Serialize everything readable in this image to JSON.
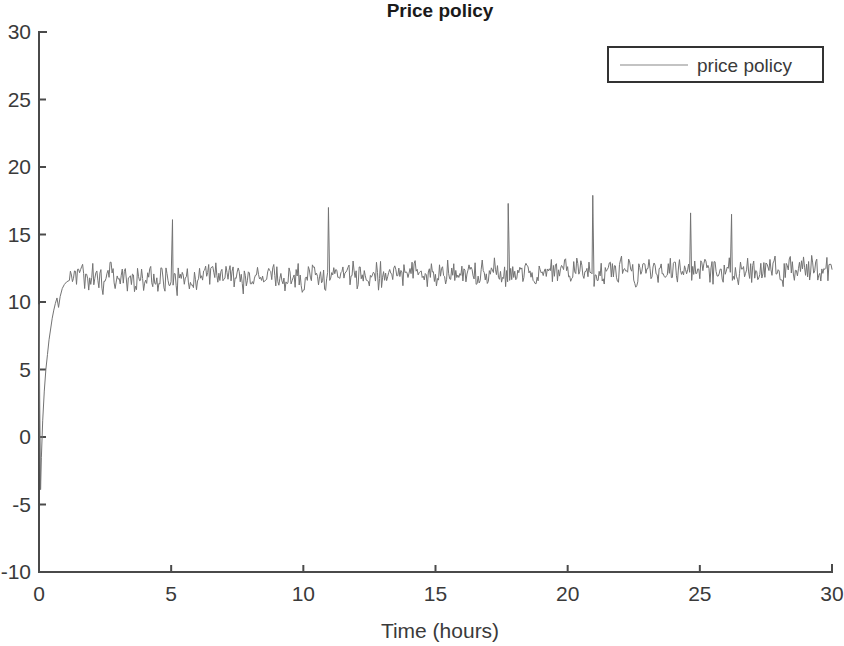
{
  "chart_data": {
    "type": "line",
    "title": "Price policy",
    "xlabel": "Time (hours)",
    "ylabel": "",
    "xlim": [
      0,
      30
    ],
    "ylim": [
      -10,
      30
    ],
    "xticks": [
      0,
      5,
      10,
      15,
      20,
      25,
      30
    ],
    "yticks": [
      -10,
      -5,
      0,
      5,
      10,
      15,
      20,
      25,
      30
    ],
    "xtick_labels": [
      "0",
      "5",
      "10",
      "15",
      "20",
      "25",
      "30"
    ],
    "ytick_labels": [
      "-10",
      "-5",
      "0",
      "5",
      "10",
      "15",
      "20",
      "25",
      "30"
    ],
    "grid": false,
    "legend_position": "top-right",
    "series": [
      {
        "name": "price policy",
        "color": "#737373",
        "description": "Noisy price signal: sharp negative transient at start dropping to about -4, rapid rise through 0 and 5 to settle near 12.3 by t=1, then a noisy steady-state band roughly 10.8 to 13.8 for the remainder, punctuated by occasional upward spikes.",
        "transient": {
          "points": [
            [
              0.0,
              9.8
            ],
            [
              0.03,
              2.0
            ],
            [
              0.06,
              -3.9
            ],
            [
              0.09,
              -1.5
            ],
            [
              0.14,
              1.2
            ],
            [
              0.2,
              3.4
            ],
            [
              0.26,
              5.0
            ],
            [
              0.32,
              6.1
            ],
            [
              0.38,
              7.2
            ],
            [
              0.44,
              8.0
            ],
            [
              0.5,
              8.8
            ],
            [
              0.56,
              9.4
            ],
            [
              0.62,
              9.9
            ],
            [
              0.68,
              10.3
            ],
            [
              0.74,
              9.6
            ],
            [
              0.8,
              10.4
            ],
            [
              0.88,
              11.0
            ],
            [
              0.96,
              11.3
            ],
            [
              1.05,
              11.5
            ],
            [
              1.15,
              11.6
            ]
          ]
        },
        "steady_state": {
          "start_time": 1.15,
          "end_time": 30.0,
          "samples_per_hour": 26,
          "mean_start": 11.7,
          "mean_end": 12.45,
          "noise_amplitude": 1.05,
          "seed": 20240517
        },
        "spikes": [
          {
            "time": 5.05,
            "value": 16.1
          },
          {
            "time": 10.95,
            "value": 17.0
          },
          {
            "time": 17.75,
            "value": 17.3
          },
          {
            "time": 20.95,
            "value": 17.9
          },
          {
            "time": 24.65,
            "value": 16.6
          },
          {
            "time": 26.2,
            "value": 16.5
          }
        ]
      }
    ]
  },
  "legend": {
    "entries": [
      {
        "label": "price policy"
      }
    ]
  }
}
